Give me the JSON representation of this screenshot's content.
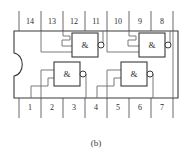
{
  "figure": {
    "caption": "(b)",
    "package": {
      "type": "DIP-14",
      "notch": "left-side-semicircular-key",
      "outline_color": "#3a3a3a",
      "wire_color": "#6b6b6b",
      "label_color": "#2b2b2b"
    },
    "pins_top": [
      {
        "number": "14",
        "x": 30
      },
      {
        "number": "13",
        "x": 52
      },
      {
        "number": "12",
        "x": 74
      },
      {
        "number": "11",
        "x": 96
      },
      {
        "number": "10",
        "x": 118
      },
      {
        "number": "9",
        "x": 140
      },
      {
        "number": "8",
        "x": 162
      }
    ],
    "pins_bottom": [
      {
        "number": "1",
        "x": 30
      },
      {
        "number": "2",
        "x": 52
      },
      {
        "number": "3",
        "x": 74
      },
      {
        "number": "4",
        "x": 96
      },
      {
        "number": "5",
        "x": 118
      },
      {
        "number": "6",
        "x": 140
      },
      {
        "number": "7",
        "x": 162
      }
    ],
    "gates": [
      {
        "id": "gate-top-left",
        "symbol": "&",
        "inverting": true,
        "x": 72,
        "y": 33
      },
      {
        "id": "gate-top-right",
        "symbol": "&",
        "inverting": true,
        "x": 139,
        "y": 33
      },
      {
        "id": "gate-bottom-left",
        "symbol": "&",
        "inverting": true,
        "x": 54,
        "y": 67
      },
      {
        "id": "gate-bottom-right",
        "symbol": "&",
        "inverting": true,
        "x": 121,
        "y": 67
      }
    ]
  }
}
